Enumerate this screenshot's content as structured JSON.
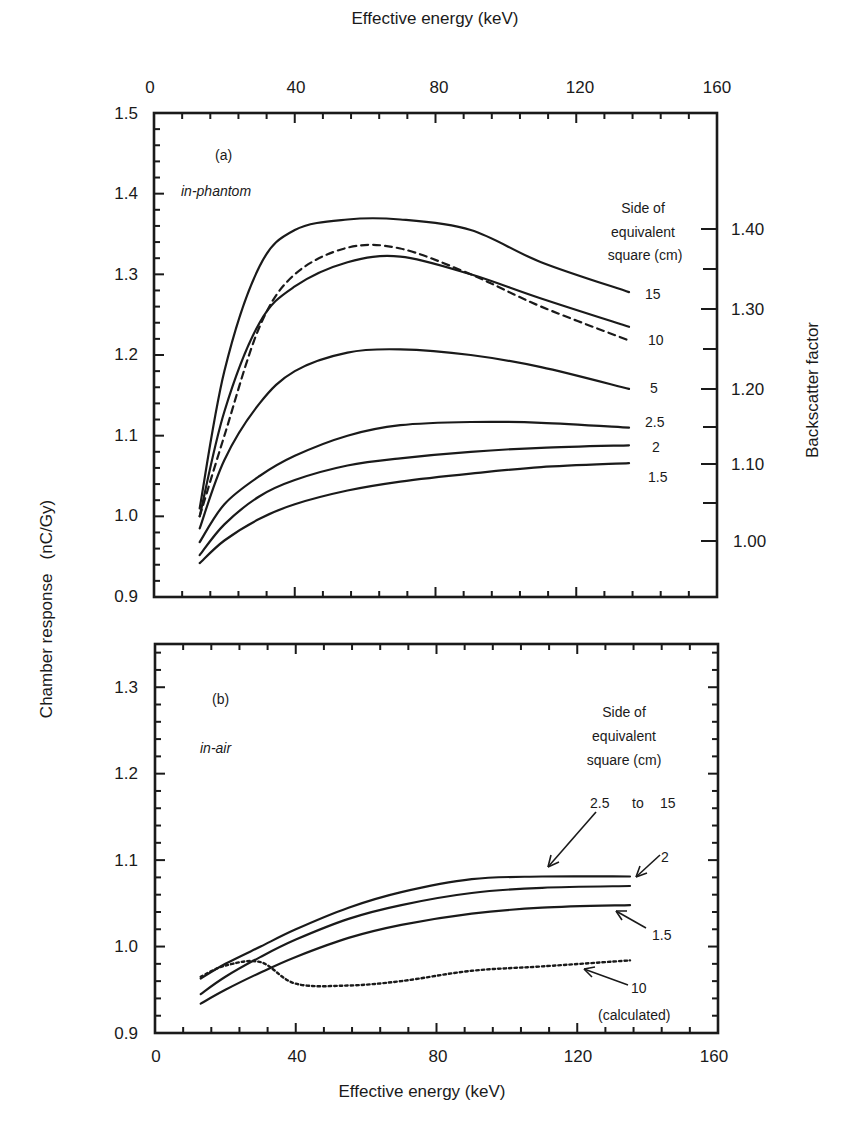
{
  "chart_data": [
    {
      "type": "line",
      "panel": "(a)",
      "subtitle": "in-phantom",
      "title": "",
      "xlabel": "Effective energy (keV)",
      "ylabel": "Chamber response   (nC/Gy)",
      "y2label": "Backscatter factor",
      "xlim": [
        0,
        160
      ],
      "ylim": [
        0.9,
        1.5
      ],
      "xticks": [
        "0",
        "40",
        "80",
        "120",
        "160"
      ],
      "yticks": [
        "0.9",
        "1.0",
        "1.1",
        "1.2",
        "1.3",
        "1.4",
        "1.5"
      ],
      "y2ticks": [
        "1.00",
        "1.10",
        "1.20",
        "1.30",
        "1.40"
      ],
      "legend_title": [
        "Side of",
        "equivalent",
        "square (cm)"
      ],
      "x": [
        13,
        20,
        30,
        40,
        55,
        70,
        90,
        110,
        135
      ],
      "series": [
        {
          "name": "15",
          "style": "solid",
          "values": [
            1.01,
            1.18,
            1.31,
            1.355,
            1.368,
            1.368,
            1.355,
            1.315,
            1.278
          ]
        },
        {
          "name": "10",
          "style": "solid",
          "values": [
            1.0,
            1.13,
            1.24,
            1.285,
            1.315,
            1.322,
            1.3,
            1.27,
            1.235
          ]
        },
        {
          "name": "10 (dashed)",
          "style": "dashed",
          "values": [
            1.0,
            1.1,
            1.235,
            1.3,
            1.333,
            1.332,
            1.3,
            1.26,
            1.218
          ]
        },
        {
          "name": "5",
          "style": "solid",
          "values": [
            0.985,
            1.07,
            1.14,
            1.18,
            1.203,
            1.207,
            1.2,
            1.185,
            1.158
          ]
        },
        {
          "name": "2.5",
          "style": "solid",
          "values": [
            0.968,
            1.015,
            1.05,
            1.075,
            1.1,
            1.113,
            1.117,
            1.116,
            1.11
          ]
        },
        {
          "name": "2",
          "style": "solid",
          "values": [
            0.952,
            0.99,
            1.025,
            1.045,
            1.063,
            1.072,
            1.08,
            1.085,
            1.088
          ]
        },
        {
          "name": "1.5",
          "style": "solid",
          "values": [
            0.942,
            0.97,
            0.997,
            1.015,
            1.032,
            1.043,
            1.053,
            1.061,
            1.066
          ]
        }
      ],
      "curve_labels": [
        "15",
        "10",
        "5",
        "2.5",
        "2",
        "1.5"
      ]
    },
    {
      "type": "line",
      "panel": "(b)",
      "subtitle": "in-air",
      "title": "",
      "xlabel": "Effective energy (keV)",
      "ylabel": "Chamber response   (nC/Gy)",
      "xlim": [
        0,
        160
      ],
      "ylim": [
        0.9,
        1.35
      ],
      "xticks": [
        "0",
        "40",
        "80",
        "120",
        "160"
      ],
      "yticks": [
        "0.9",
        "1.0",
        "1.1",
        "1.2",
        "1.3"
      ],
      "legend_title": [
        "Side of",
        "equivalent",
        "square (cm)"
      ],
      "x": [
        13,
        20,
        30,
        40,
        55,
        70,
        90,
        110,
        135
      ],
      "series": [
        {
          "name": "2.5 to 15",
          "style": "solid",
          "values": [
            0.963,
            0.98,
            1.0,
            1.02,
            1.045,
            1.063,
            1.078,
            1.081,
            1.081
          ]
        },
        {
          "name": "2",
          "style": "solid",
          "values": [
            0.945,
            0.965,
            0.988,
            1.008,
            1.032,
            1.048,
            1.062,
            1.068,
            1.07
          ]
        },
        {
          "name": "1.5",
          "style": "solid",
          "values": [
            0.934,
            0.95,
            0.97,
            0.988,
            1.01,
            1.025,
            1.038,
            1.045,
            1.048
          ]
        },
        {
          "name": "10 (calculated)",
          "style": "dotted",
          "values": [
            0.965,
            0.978,
            0.982,
            0.957,
            0.955,
            0.96,
            0.972,
            0.977,
            0.984
          ]
        }
      ],
      "annotations": [
        "2.5",
        "to",
        "15",
        "2",
        "1.5",
        "10",
        "(calculated)"
      ]
    }
  ],
  "labels": {
    "top_axis_title": "Effective energy (keV)",
    "bottom_axis_title": "Effective energy (keV)",
    "left_axis_title": "Chamber response   (nC/Gy)",
    "right_axis_title": "Backscatter factor",
    "panel_a": "(a)",
    "panel_a_sub": "in-phantom",
    "panel_b": "(b)",
    "panel_b_sub": "in-air",
    "legend_a": [
      "Side of",
      "equivalent",
      "square (cm)"
    ],
    "legend_b": [
      "Side of",
      "equivalent",
      "square (cm)"
    ],
    "a_curve_labels": {
      "c15": "15",
      "c10": "10",
      "c5": "5",
      "c25": "2.5",
      "c2": "2",
      "c15s": "1.5"
    },
    "b_labels": {
      "range_from": "2.5",
      "range_to_word": "to",
      "range_to": "15",
      "two": "2",
      "one_five": "1.5",
      "ten": "10",
      "calc": "(calculated)"
    },
    "x_ticks": [
      "0",
      "40",
      "80",
      "120",
      "160"
    ],
    "a_y_ticks": [
      "1.5",
      "1.4",
      "1.3",
      "1.2",
      "1.1",
      "1.0",
      "0.9"
    ],
    "a_y2_ticks": [
      "1.40",
      "1.30",
      "1.20",
      "1.10",
      "1.00"
    ],
    "b_y_ticks": [
      "1.3",
      "1.2",
      "1.1",
      "1.0",
      "0.9"
    ]
  }
}
